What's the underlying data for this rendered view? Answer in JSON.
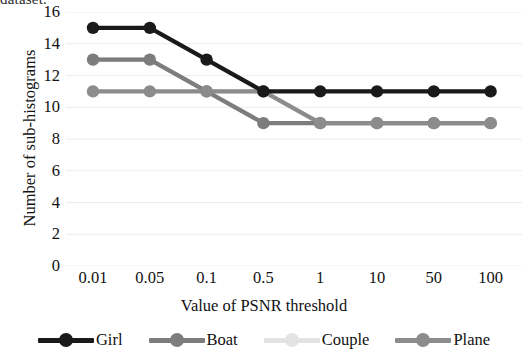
{
  "top_cropped_text": "dataset.",
  "axes": {
    "y_title": "Number of sub-histograms",
    "x_title": "Value of PSNR threshold",
    "y_ticks": [
      "0",
      "2",
      "4",
      "6",
      "8",
      "10",
      "12",
      "14",
      "16"
    ],
    "x_ticks": [
      "0.01",
      "0.05",
      "0.1",
      "0.5",
      "1",
      "10",
      "50",
      "100"
    ]
  },
  "legend": {
    "items": [
      {
        "label": "Girl",
        "color": "#1a1a1a",
        "marker": "circle-marker"
      },
      {
        "label": "Boat",
        "color": "#7d7d7d",
        "marker": "circle-marker"
      },
      {
        "label": "Couple",
        "color": "#e3e3e3",
        "marker": "circle-marker"
      },
      {
        "label": "Plane",
        "color": "#8c8c8c",
        "marker": "circle-marker"
      }
    ]
  },
  "chart_data": {
    "type": "line",
    "title": "",
    "xlabel": "Value of PSNR threshold",
    "ylabel": "Number of sub-histograms",
    "categories": [
      "0.01",
      "0.05",
      "0.1",
      "0.5",
      "1",
      "10",
      "50",
      "100"
    ],
    "ylim": [
      0,
      16
    ],
    "ytick_step": 2,
    "grid": "horizontal",
    "legend_position": "bottom",
    "series": [
      {
        "name": "Girl",
        "color": "#1a1a1a",
        "values": [
          15,
          15,
          13,
          11,
          11,
          11,
          11,
          11
        ]
      },
      {
        "name": "Boat",
        "color": "#7d7d7d",
        "values": [
          13,
          13,
          11,
          9,
          9,
          9,
          9,
          9
        ]
      },
      {
        "name": "Couple",
        "color": "#e3e3e3",
        "values": [
          13,
          13,
          11,
          11,
          9,
          9,
          9,
          9
        ]
      },
      {
        "name": "Plane",
        "color": "#8c8c8c",
        "values": [
          11,
          11,
          11,
          11,
          9,
          9,
          9,
          9
        ]
      }
    ]
  }
}
